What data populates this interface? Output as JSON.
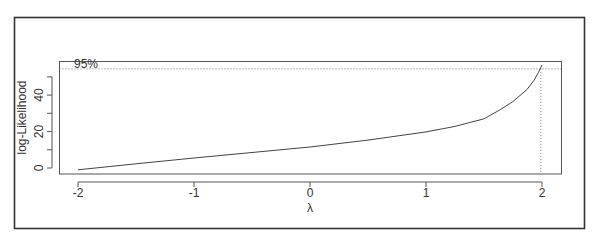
{
  "chart_data": {
    "type": "line",
    "title": "",
    "xlabel": "λ",
    "ylabel": "log-Likelihood",
    "xlim": [
      -2.15,
      2.17
    ],
    "ylim": [
      -3,
      58.5
    ],
    "xticks": [
      -2,
      -1,
      0,
      1,
      2
    ],
    "xtick_labels": [
      "-2",
      "-1",
      "0",
      "1",
      "2"
    ],
    "yticks": [
      0,
      10,
      20,
      30,
      40,
      50
    ],
    "ytick_labels": [
      "0",
      "",
      "20",
      "",
      "40",
      ""
    ],
    "grid": false,
    "legend": null,
    "series": [
      {
        "name": "profile log-likelihood",
        "x": [
          -2.0,
          -1.5,
          -1.0,
          -0.5,
          0.0,
          0.5,
          1.0,
          1.25,
          1.5,
          1.64,
          1.75,
          1.87,
          1.93,
          1.97,
          2.0
        ],
        "y": [
          -1.0,
          2.3,
          5.5,
          8.5,
          11.5,
          15.3,
          19.8,
          22.8,
          27.0,
          32.0,
          36.5,
          43.0,
          48.0,
          52.5,
          56.5
        ]
      }
    ],
    "annotations": [
      {
        "type": "hline",
        "y": 54.4,
        "style": "dotted",
        "label": "95%"
      },
      {
        "type": "vline",
        "x": 1.99,
        "style": "dotted"
      }
    ]
  }
}
